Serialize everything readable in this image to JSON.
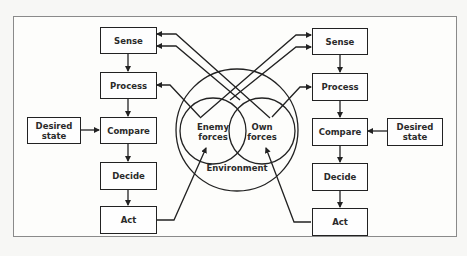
{
  "diagram": {
    "type": "dual feedback-loop (OODA-style) control diagram",
    "left_loop": {
      "steps": [
        "Sense",
        "Process",
        "Compare",
        "Decide",
        "Act"
      ],
      "reference": "Desired state"
    },
    "right_loop": {
      "steps": [
        "Sense",
        "Process",
        "Compare",
        "Decide",
        "Act"
      ],
      "reference": "Desired state"
    },
    "environment": {
      "outer_label": "Environment",
      "enemy_label_line1": "Enemy",
      "enemy_label_line2": "forces",
      "own_label_line1": "Own",
      "own_label_line2": "forces"
    },
    "colors": {
      "stroke": "#222222",
      "frame": "#8a8a8a",
      "background": "#fdfdfb"
    }
  }
}
